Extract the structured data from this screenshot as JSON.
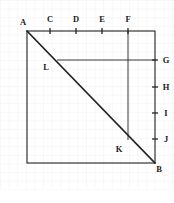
{
  "figure": {
    "width": 174,
    "height": 203,
    "background_color": "#ffffff",
    "grid": {
      "visible": true,
      "cell_size": 8.6,
      "color": "#eeeef1",
      "major_color": "#e4e4e9"
    },
    "stroke_color": "#222222",
    "label_color": "#1a1a1a"
  },
  "square": {
    "name": "ABCD-square",
    "left": 27,
    "top": 31,
    "right": 155,
    "bottom": 163
  },
  "diagonal": {
    "name": "diagonal-A-to-B",
    "from": "A",
    "to": "B",
    "x1": 27,
    "y1": 31,
    "x2": 155,
    "y2": 163,
    "stroke_width": 1.6
  },
  "segments": [
    {
      "name": "segment-L-to-G",
      "label": "L-G horizontal",
      "x1": 57,
      "y1": 60,
      "x2": 155,
      "y2": 60,
      "stroke_width": 0.9
    },
    {
      "name": "segment-F-to-K",
      "label": "F-K vertical",
      "x1": 128,
      "y1": 31,
      "x2": 128,
      "y2": 140,
      "stroke_width": 0.9
    }
  ],
  "top_ticks": [
    {
      "label": "C",
      "x": 50,
      "y": 31,
      "tick_length": 6
    },
    {
      "label": "D",
      "x": 76,
      "y": 31,
      "tick_length": 6
    },
    {
      "label": "E",
      "x": 102,
      "y": 31,
      "tick_length": 6
    },
    {
      "label": "F",
      "x": 128,
      "y": 31,
      "tick_length": 6
    }
  ],
  "right_ticks": [
    {
      "label": "G",
      "x": 155,
      "y": 60,
      "tick_length": 6
    },
    {
      "label": "H",
      "x": 155,
      "y": 87,
      "tick_length": 6
    },
    {
      "label": "I",
      "x": 155,
      "y": 113,
      "tick_length": 6
    },
    {
      "label": "J",
      "x": 155,
      "y": 139,
      "tick_length": 6
    }
  ],
  "vertices": [
    {
      "label": "A",
      "point_x": 27,
      "point_y": 31,
      "label_x": 23,
      "label_y": 25
    },
    {
      "label": "B",
      "point_x": 155,
      "point_y": 163,
      "label_x": 159,
      "label_y": 172
    },
    {
      "label": "L",
      "point_x": 57,
      "point_y": 60,
      "label_x": 46,
      "label_y": 70
    },
    {
      "label": "K",
      "point_x": 128,
      "point_y": 140,
      "label_x": 119,
      "label_y": 152
    }
  ],
  "tick_text_offsets": {
    "top_label_dy": -9,
    "right_label_dx": 11,
    "right_label_dy": 3
  }
}
